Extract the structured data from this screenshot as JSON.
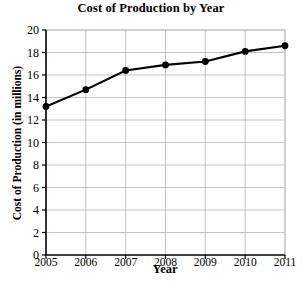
{
  "chart_data": {
    "type": "line",
    "title": "Cost of Production by Year",
    "xlabel": "Year",
    "ylabel": "Cost of Production (in millions)",
    "categories": [
      "2005",
      "2006",
      "2007",
      "2008",
      "2009",
      "2010",
      "2011"
    ],
    "x": [
      2005,
      2006,
      2007,
      2008,
      2009,
      2010,
      2011
    ],
    "values": [
      13.2,
      14.7,
      16.4,
      16.9,
      17.2,
      18.1,
      18.6
    ],
    "series": [
      {
        "name": "Cost of Production",
        "values": [
          13.2,
          14.7,
          16.4,
          16.9,
          17.2,
          18.1,
          18.6
        ]
      }
    ],
    "ylim": [
      0,
      20
    ],
    "xlim": [
      2005,
      2011
    ],
    "yticks": [
      0,
      2,
      4,
      6,
      8,
      10,
      12,
      14,
      16,
      18,
      20
    ],
    "ytick_labels": [
      "0",
      "2",
      "4",
      "6",
      "8",
      "10",
      "12",
      "14",
      "16",
      "18",
      "20"
    ],
    "xticks": [
      2005,
      2006,
      2007,
      2008,
      2009,
      2010,
      2011
    ],
    "xtick_labels": [
      "2005",
      "2006",
      "2007",
      "2008",
      "2009",
      "2010",
      "2011"
    ],
    "grid": true,
    "grid_axis": "both",
    "legend": false,
    "legend_position": "none",
    "marker": "circle",
    "line_color": "#000000",
    "marker_color": "#000000",
    "grid_color": "#b5b5b5",
    "axis_color": "#000000",
    "background_color": "#ffffff"
  }
}
